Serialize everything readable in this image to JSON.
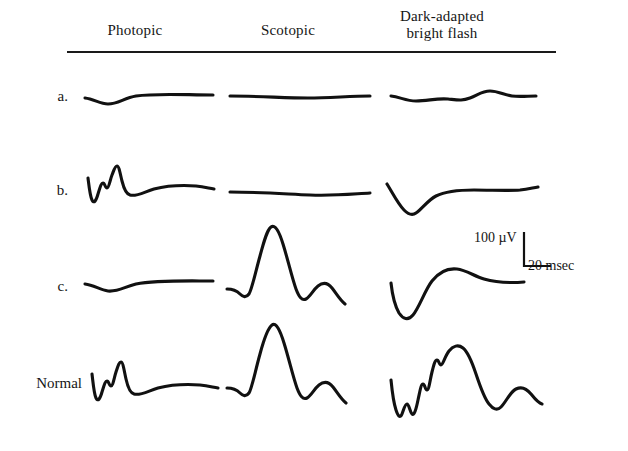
{
  "figure": {
    "type": "erg-waveform-panel",
    "background": "#ffffff",
    "trace_color": "#111111"
  },
  "headers": {
    "photopic": "Photopic",
    "scotopic": "Scotopic",
    "dark_adapted_line1": "Dark-adapted",
    "dark_adapted_line2": "bright flash",
    "dark_adapted": "Dark-adapted bright flash"
  },
  "row_labels": {
    "a": "a.",
    "b": "b.",
    "c": "c.",
    "normal": "Normal"
  },
  "scale": {
    "vertical_label": "100 µV",
    "horizontal_label": "20 msec",
    "vertical_value": 100,
    "vertical_unit": "µV",
    "horizontal_value": 20,
    "horizontal_unit": "msec"
  },
  "chart_data": {
    "type": "line",
    "title": "",
    "xlabel": "20 msec",
    "ylabel": "100 µV",
    "grid": false,
    "legend": "none",
    "columns": [
      "Photopic",
      "Scotopic",
      "Dark-adapted bright flash"
    ],
    "rows": [
      "a.",
      "b.",
      "c.",
      "Normal"
    ],
    "scale_bar": {
      "amplitude_uV": 100,
      "time_msec": 20
    },
    "traces": [
      {
        "row": "a.",
        "column": "Photopic",
        "description": "extinguished flat photopic response with slight downward drift",
        "path": "M85,98 C94,99 100,104 108,104 C118,104 124,98 136,96 C156,93 186,95 213,95"
      },
      {
        "row": "a.",
        "column": "Scotopic",
        "description": "extinguished flat scotopic response",
        "path": "M230,96 C258,96 286,98 308,98 C330,98 350,96 370,96"
      },
      {
        "row": "a.",
        "column": "Dark-adapted bright flash",
        "description": "near-flat dark-adapted response with small residual ripples",
        "path": "M391,96 C400,97 406,101 416,101 C428,101 436,98 448,99 C458,100 462,101 470,98 C478,95 482,91 490,91 C498,91 504,95 512,96 C520,97 528,96 536,96"
      },
      {
        "row": "b.",
        "column": "Photopic",
        "description": "reduced photopic response with a-wave, oscillatory notches and small b-wave",
        "path": "M88,178 C89,186 90,196 92,200 C94,204 96,201 98,194 C100,188 101,183 103,183 C105,183 105,188 107,188 C109,188 110,180 112,175 C114,170 115,166 117,166 C119,166 120,173 122,181 C124,189 126,194 130,195 C136,197 144,192 154,189 C166,186 182,185 196,186 C204,187 208,188 214,189"
      },
      {
        "row": "b.",
        "column": "Scotopic",
        "description": "extinguished flat scotopic response",
        "path": "M230,192 C258,192 286,194 310,195 C334,196 352,194 370,193"
      },
      {
        "row": "b.",
        "column": "Dark-adapted bright flash",
        "description": "negative a-wave only, no b-wave recovery (negative ERG)",
        "path": "M387,184 C392,192 398,204 404,210 C408,214 412,216 416,213 C422,209 428,200 436,196 C446,191 460,190 474,190 C492,190 508,191 520,190 C528,189 532,188 538,187"
      },
      {
        "row": "c.",
        "column": "Photopic",
        "description": "markedly reduced photopic response, nearly flat",
        "path": "M85,284 C94,285 100,290 108,291 C118,292 124,287 136,284 C156,280 186,281 213,281"
      },
      {
        "row": "c.",
        "column": "Scotopic",
        "description": "robust scotopic response: small a-wave, tall b-wave, trough and secondary bump",
        "path": "M227,289 C232,289 236,290 240,294 C243,297 246,298 249,294 C252,289 255,274 260,256 C264,241 267,230 271,227 C275,224 279,231 283,244 C288,260 292,278 296,289 C299,297 302,301 306,299 C310,297 313,290 318,286 C323,282 328,283 332,288 C336,293 340,300 345,304"
      },
      {
        "row": "c.",
        "column": "Dark-adapted bright flash",
        "description": "deep negative a-wave with partial slow recovery, no true b-wave",
        "path": "M391,283 C392,292 395,306 399,313 C403,319 408,321 413,315 C419,308 425,290 432,281 C439,272 448,268 457,269 C466,270 474,276 484,279 C498,283 512,283 524,282"
      },
      {
        "row": "Normal",
        "column": "Photopic",
        "description": "normal photopic ERG with a-wave, oscillatory potentials and b-wave",
        "path": "M92,374 C93,382 94,394 96,398 C98,402 100,399 102,392 C104,386 105,381 107,381 C109,381 109,386 111,386 C113,386 114,378 116,372 C118,366 119,362 121,362 C123,362 124,370 126,379 C128,388 130,393 134,394 C140,396 148,391 158,388 C170,385 186,384 200,385 C208,386 212,387 218,388"
      },
      {
        "row": "Normal",
        "column": "Scotopic",
        "description": "normal scotopic ERG: a-wave, large b-wave, trough and secondary wave",
        "path": "M227,388 C232,388 236,389 240,393 C243,396 246,397 249,393 C252,388 255,372 260,354 C264,339 268,328 272,325 C276,322 280,330 284,343 C289,359 293,377 297,388 C300,396 303,400 307,398 C311,396 314,389 319,385 C324,381 329,382 333,387 C337,392 341,399 346,403"
      },
      {
        "row": "Normal",
        "column": "Dark-adapted bright flash",
        "description": "normal dark-adapted bright flash: sharp a-wave, oscillatory potentials on b-wave ascent, large b-wave and secondary wave",
        "path": "M391,380 C392,390 394,404 396,410 C398,416 400,419 402,414 C404,409 405,404 407,404 C409,404 410,412 412,414 C414,416 416,410 418,400 C420,391 421,384 423,384 C425,384 425,390 427,390 C429,390 430,380 432,372 C434,364 435,360 437,360 C439,360 439,365 441,365 C443,365 445,356 449,351 C453,346 458,344 463,348 C468,352 472,362 476,374 C480,386 484,398 489,404 C493,409 497,411 501,407 C506,402 510,392 516,389 C522,386 527,389 531,394 C535,399 538,403 542,404"
      }
    ]
  }
}
